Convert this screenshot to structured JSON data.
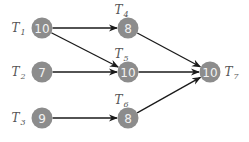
{
  "diagram": {
    "type": "task-dependency-graph",
    "colors": {
      "node_fill": "#8c8c8c",
      "node_text": "#f2f2f2",
      "edge": "#1a1a1a",
      "label": "#555555"
    },
    "nodes": [
      {
        "id": "T1",
        "letter": "T",
        "sub": "1",
        "value": "10",
        "cx": 42,
        "cy": 28,
        "label_pos": "left"
      },
      {
        "id": "T2",
        "letter": "T",
        "sub": "2",
        "value": "7",
        "cx": 42,
        "cy": 72,
        "label_pos": "left"
      },
      {
        "id": "T3",
        "letter": "T",
        "sub": "3",
        "value": "9",
        "cx": 42,
        "cy": 118,
        "label_pos": "left"
      },
      {
        "id": "T4",
        "letter": "T",
        "sub": "4",
        "value": "8",
        "cx": 128,
        "cy": 28,
        "label_pos": "top-left"
      },
      {
        "id": "T5",
        "letter": "T",
        "sub": "5",
        "value": "10",
        "cx": 128,
        "cy": 72,
        "label_pos": "top-left"
      },
      {
        "id": "T6",
        "letter": "T",
        "sub": "6",
        "value": "8",
        "cx": 128,
        "cy": 118,
        "label_pos": "top-left"
      },
      {
        "id": "T7",
        "letter": "T",
        "sub": "7",
        "value": "10",
        "cx": 210,
        "cy": 72,
        "label_pos": "right"
      }
    ],
    "edges": [
      {
        "from": "T1",
        "to": "T4"
      },
      {
        "from": "T1",
        "to": "T5"
      },
      {
        "from": "T2",
        "to": "T5"
      },
      {
        "from": "T3",
        "to": "T6"
      },
      {
        "from": "T4",
        "to": "T7"
      },
      {
        "from": "T5",
        "to": "T7"
      },
      {
        "from": "T6",
        "to": "T7"
      }
    ]
  }
}
